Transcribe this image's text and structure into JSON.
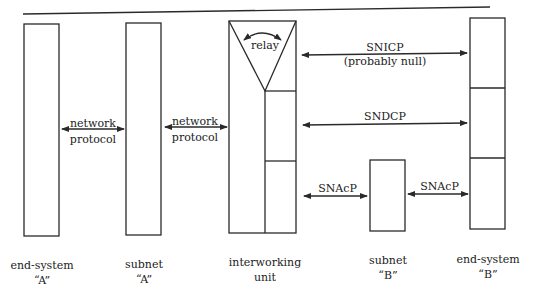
{
  "diagram": {
    "type": "protocol-layer-diagram",
    "colors": {
      "line": "#2a2a2a",
      "background": "#ffffff"
    },
    "nodes": [
      {
        "id": "end-system-a",
        "label_line1": "end-system",
        "label_line2": "“A”"
      },
      {
        "id": "subnet-a",
        "label_line1": "subnet",
        "label_line2": "“A”"
      },
      {
        "id": "interworking-unit",
        "label_line1": "interworking",
        "label_line2": "unit",
        "inner_label": "relay"
      },
      {
        "id": "subnet-b",
        "label_line1": "subnet",
        "label_line2": "“B”"
      },
      {
        "id": "end-system-b",
        "label_line1": "end-system",
        "label_line2": "“B”"
      }
    ],
    "links": [
      {
        "id": "net-proto-1",
        "label_line1": "network",
        "label_line2": "protocol"
      },
      {
        "id": "net-proto-2",
        "label_line1": "network",
        "label_line2": "protocol"
      },
      {
        "id": "snicp",
        "label_line1": "SNICP",
        "label_line2": "(probably null)"
      },
      {
        "id": "sndcp",
        "label_line1": "SNDCP"
      },
      {
        "id": "snacp-1",
        "label_line1": "SNAcP"
      },
      {
        "id": "snacp-2",
        "label_line1": "SNAcP"
      }
    ]
  }
}
